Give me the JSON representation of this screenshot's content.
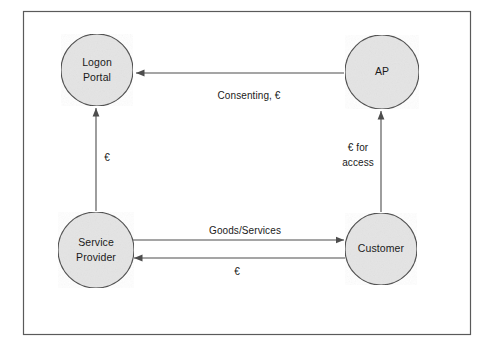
{
  "diagram": {
    "frame": {
      "name": "diagram-border",
      "x": 23,
      "y": 11,
      "width": 447,
      "height": 323,
      "stroke": "#5a5a5a"
    },
    "colors": {
      "node_fill": "#e4e4e4",
      "node_stroke": "#4a4a4a",
      "edge_stroke": "#4d4d4d",
      "text": "#1a1a1a",
      "background": "#ffffff"
    },
    "nodes": [
      {
        "id": "logon-portal",
        "lines": [
          "Logon",
          "Portal"
        ],
        "cx": 97,
        "cy": 70,
        "r": 36
      },
      {
        "id": "ap",
        "lines": [
          "AP"
        ],
        "cx": 382,
        "cy": 72,
        "r": 37
      },
      {
        "id": "service-provider",
        "lines": [
          "Service",
          "Provider"
        ],
        "cx": 96,
        "cy": 250,
        "r": 38
      },
      {
        "id": "customer",
        "lines": [
          "Customer"
        ],
        "cx": 381,
        "cy": 249,
        "r": 36
      }
    ],
    "edges": [
      {
        "id": "ap-to-logon-portal",
        "from": "ap",
        "to": "logon-portal",
        "label": "Consenting, €",
        "label_x": 249,
        "label_y": 96,
        "direction": "left"
      },
      {
        "id": "customer-to-ap",
        "from": "customer",
        "to": "ap",
        "label_lines": [
          "€ for",
          "access"
        ],
        "label_x": 358,
        "label_y": 155,
        "direction": "up"
      },
      {
        "id": "service-provider-to-logon-portal",
        "from": "service-provider",
        "to": "logon-portal",
        "label": "€",
        "label_x": 107,
        "label_y": 158,
        "direction": "up"
      },
      {
        "id": "service-provider-to-customer",
        "from": "service-provider",
        "to": "customer",
        "label": "Goods/Services",
        "label_x": 245,
        "label_y": 231,
        "direction": "right"
      },
      {
        "id": "customer-to-service-provider",
        "from": "customer",
        "to": "service-provider",
        "label": "€",
        "label_x": 237,
        "label_y": 272,
        "direction": "left"
      }
    ]
  }
}
